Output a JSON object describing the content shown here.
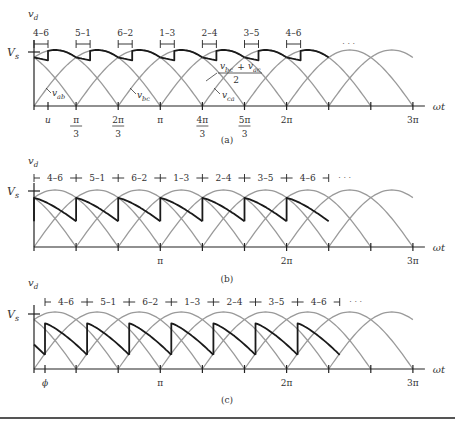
{
  "figure": {
    "colors": {
      "axis": "#222222",
      "thin_curve": "#9a9a9a",
      "output_curve": "#1a1a1a",
      "text": "#333333",
      "rule": "#555555"
    },
    "x_axis_label": "ωt",
    "y_axis_label": "v",
    "y_axis_label_sub": "d",
    "vs_label": "V",
    "vs_label_sub": "s",
    "ellipsis": "· · ·",
    "panels": [
      {
        "id": "a",
        "caption": "(a)",
        "baseline_y": 106,
        "vs_y": 52,
        "top_y": 50,
        "mode": "overlap",
        "overlap_px": 14,
        "commutation_labels": [
          "4–6",
          "5–1",
          "6–2",
          "1–3",
          "2–4",
          "3–5",
          "4–6"
        ],
        "x_ticks": [
          {
            "pos": "u",
            "label": "u"
          },
          {
            "pos": 1,
            "num": "π",
            "den": "3"
          },
          {
            "pos": 2,
            "num": "2π",
            "den": "3"
          },
          {
            "pos": 3,
            "label": "π"
          },
          {
            "pos": 4,
            "num": "4π",
            "den": "3"
          },
          {
            "pos": 5,
            "num": "5π",
            "den": "3"
          },
          {
            "pos": 6,
            "label": "2π"
          },
          {
            "pos": 7,
            "label": ""
          },
          {
            "pos": 8,
            "label": ""
          },
          {
            "pos": 9,
            "label": "3π"
          }
        ],
        "curve_labels": [
          {
            "text": "v",
            "sub": "ab",
            "x": 52,
            "y": 96
          },
          {
            "text": "v",
            "sub": "bc",
            "x": 137,
            "y": 98
          },
          {
            "text": "v",
            "sub": "ca",
            "x": 222,
            "y": 98
          }
        ],
        "average_label": {
          "num_a": "v",
          "num_a_sub": "bc",
          "plus": "+",
          "num_b": "v",
          "num_b_sub": "ac",
          "den": "2"
        }
      },
      {
        "id": "b",
        "caption": "(b)",
        "baseline_y": 247,
        "vs_y": 191,
        "top_y": 190,
        "mode": "delay",
        "commutation_labels": [
          "4–6",
          "5–1",
          "6–2",
          "1–3",
          "2–4",
          "3–5",
          "4–6"
        ],
        "x_ticks": [
          {
            "pos": 1,
            "label": ""
          },
          {
            "pos": 2,
            "label": ""
          },
          {
            "pos": 3,
            "label": "π"
          },
          {
            "pos": 4,
            "label": ""
          },
          {
            "pos": 5,
            "label": ""
          },
          {
            "pos": 6,
            "label": "2π"
          },
          {
            "pos": 7,
            "label": ""
          },
          {
            "pos": 8,
            "label": ""
          },
          {
            "pos": 9,
            "label": "3π"
          }
        ]
      },
      {
        "id": "c",
        "caption": "(c)",
        "baseline_y": 369,
        "vs_y": 314,
        "top_y": 312,
        "mode": "delay_phi",
        "phi_px": 11,
        "commutation_labels": [
          "4–6",
          "5–1",
          "6–2",
          "1–3",
          "2–4",
          "3–5",
          "4–6"
        ],
        "x_ticks": [
          {
            "pos": "phi",
            "label": "ϕ"
          },
          {
            "pos": 1,
            "label": ""
          },
          {
            "pos": 2,
            "label": ""
          },
          {
            "pos": 3,
            "label": "π"
          },
          {
            "pos": 4,
            "label": ""
          },
          {
            "pos": 5,
            "label": ""
          },
          {
            "pos": 6,
            "label": "2π"
          },
          {
            "pos": 7,
            "label": ""
          },
          {
            "pos": 8,
            "label": ""
          },
          {
            "pos": 9,
            "label": "3π"
          }
        ]
      }
    ]
  }
}
